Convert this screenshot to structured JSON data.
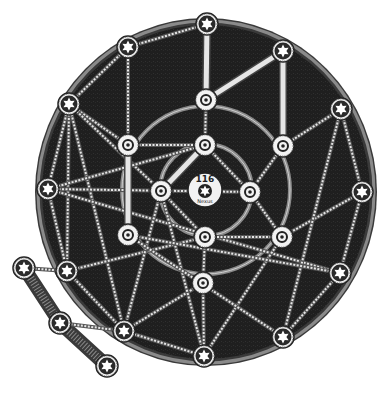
{
  "board": {
    "title": "Star network board",
    "center_label": "116",
    "center_sublabel": "Nexus",
    "colors": {
      "background": "#ffffff",
      "disc": "#1f1f1f",
      "rim": "#8a8a8a",
      "path": "#e6e6e6",
      "node_fill": "#f2f2f2",
      "node_ring": "#2a2a2a"
    },
    "disc": {
      "cx": 206,
      "cy": 192,
      "rx": 167,
      "ry": 170
    },
    "inner_rings": [
      {
        "cx": 206,
        "cy": 190,
        "r": 46
      },
      {
        "cx": 206,
        "cy": 190,
        "r": 84
      }
    ],
    "center_node": {
      "x": 205,
      "y": 190,
      "r": 17
    },
    "star_nodes": [
      {
        "id": "s1",
        "x": 207,
        "y": 24
      },
      {
        "id": "s2",
        "x": 283,
        "y": 51
      },
      {
        "id": "s3",
        "x": 341,
        "y": 109
      },
      {
        "id": "s4",
        "x": 362,
        "y": 192
      },
      {
        "id": "s5",
        "x": 340,
        "y": 273
      },
      {
        "id": "s6",
        "x": 283,
        "y": 337
      },
      {
        "id": "s7",
        "x": 204,
        "y": 356
      },
      {
        "id": "s8",
        "x": 124,
        "y": 331
      },
      {
        "id": "s9",
        "x": 67,
        "y": 271
      },
      {
        "id": "s10",
        "x": 48,
        "y": 189
      },
      {
        "id": "s11",
        "x": 69,
        "y": 104
      },
      {
        "id": "s12",
        "x": 128,
        "y": 47
      },
      {
        "id": "c1",
        "x": 24,
        "y": 268
      },
      {
        "id": "c2",
        "x": 60,
        "y": 323
      },
      {
        "id": "c3",
        "x": 107,
        "y": 366
      }
    ],
    "ring_nodes": [
      {
        "id": "r1",
        "x": 206,
        "y": 100
      },
      {
        "id": "r2",
        "x": 128,
        "y": 145
      },
      {
        "id": "r3",
        "x": 205,
        "y": 145
      },
      {
        "id": "r4",
        "x": 283,
        "y": 146
      },
      {
        "id": "r5",
        "x": 161,
        "y": 191
      },
      {
        "id": "r6",
        "x": 250,
        "y": 192
      },
      {
        "id": "r7",
        "x": 128,
        "y": 235
      },
      {
        "id": "r8",
        "x": 205,
        "y": 237
      },
      {
        "id": "r9",
        "x": 282,
        "y": 237
      },
      {
        "id": "r10",
        "x": 203,
        "y": 283
      }
    ],
    "solid_links": [
      [
        "s1",
        "r1"
      ],
      [
        "r1",
        "s2"
      ],
      [
        "s2",
        "r4"
      ],
      [
        "r2",
        "r7"
      ],
      [
        "r3",
        "r5"
      ]
    ],
    "dashed_links": [
      [
        "s12",
        "s11"
      ],
      [
        "s12",
        "r2"
      ],
      [
        "s11",
        "r2"
      ],
      [
        "s11",
        "s10"
      ],
      [
        "s11",
        "s9"
      ],
      [
        "s11",
        "s8"
      ],
      [
        "s10",
        "s9"
      ],
      [
        "s10",
        "r6"
      ],
      [
        "s10",
        "s5"
      ],
      [
        "s9",
        "s8"
      ],
      [
        "s9",
        "r8"
      ],
      [
        "s8",
        "s7"
      ],
      [
        "s8",
        "r10"
      ],
      [
        "s8",
        "r5"
      ],
      [
        "s7",
        "r5"
      ],
      [
        "s7",
        "r9"
      ],
      [
        "s6",
        "r7"
      ],
      [
        "s6",
        "s5"
      ],
      [
        "s5",
        "s4"
      ],
      [
        "s5",
        "r7"
      ],
      [
        "s4",
        "s3"
      ],
      [
        "s4",
        "r9"
      ],
      [
        "s3",
        "r4"
      ],
      [
        "s3",
        "s6"
      ],
      [
        "r4",
        "r6"
      ],
      [
        "r3",
        "r6"
      ],
      [
        "r1",
        "r3"
      ],
      [
        "r2",
        "r3"
      ],
      [
        "r5",
        "r8"
      ],
      [
        "r8",
        "r10"
      ],
      [
        "r9",
        "r8"
      ],
      [
        "r10",
        "s7"
      ],
      [
        "r6",
        "r9"
      ],
      [
        "c1",
        "s9"
      ],
      [
        "c2",
        "s8"
      ],
      [
        "s11",
        "r5"
      ],
      [
        "s10",
        "r3"
      ],
      [
        "r2",
        "s12"
      ],
      [
        "s12",
        "s1"
      ]
    ],
    "chain": [
      "c1",
      "c2",
      "c3"
    ]
  }
}
